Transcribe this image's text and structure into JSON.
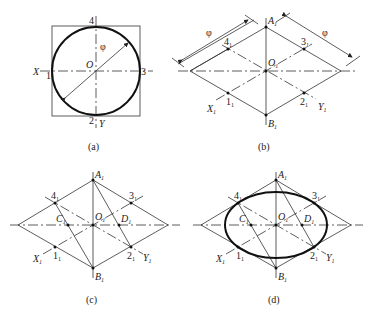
{
  "figure": {
    "panels": [
      {
        "id": "a",
        "caption": "(a)",
        "description": "Circle of diameter phi inscribed in square with X and Y axes",
        "labels": {
          "center": "O",
          "x_axis": "X",
          "y_axis": "Y",
          "p1": "1",
          "p2": "2",
          "p3": "3",
          "p4": "4",
          "diameter": "φ"
        }
      },
      {
        "id": "b",
        "caption": "(b)",
        "description": "Isometric rhombus with side phi, points 1..4 on axes",
        "labels": {
          "center": "O",
          "center_sub": "1",
          "A": "A",
          "A_sub": "1",
          "B": "B",
          "B_sub": "1",
          "X": "X",
          "X_sub": "1",
          "Y": "Y",
          "Y_sub": "1",
          "p1": "1",
          "p2": "2",
          "p3": "3",
          "p4": "4",
          "sub": "1",
          "dim_left": "φ",
          "dim_right": "φ"
        }
      },
      {
        "id": "c",
        "caption": "(c)",
        "description": "Construction of centers C1 and D1",
        "labels": {
          "center": "O",
          "A": "A",
          "B": "B",
          "C": "C",
          "D": "D",
          "X": "X",
          "Y": "Y",
          "p1": "1",
          "p2": "2",
          "p3": "3",
          "p4": "4",
          "sub": "1"
        }
      },
      {
        "id": "d",
        "caption": "(d)",
        "description": "Approximate ellipse drawn with four arcs",
        "labels": {
          "center": "O",
          "A": "A",
          "B": "B",
          "C": "C",
          "D": "D",
          "X": "X",
          "Y": "Y",
          "p1": "1",
          "p2": "2",
          "p3": "3",
          "p4": "4",
          "sub": "1"
        }
      }
    ]
  }
}
